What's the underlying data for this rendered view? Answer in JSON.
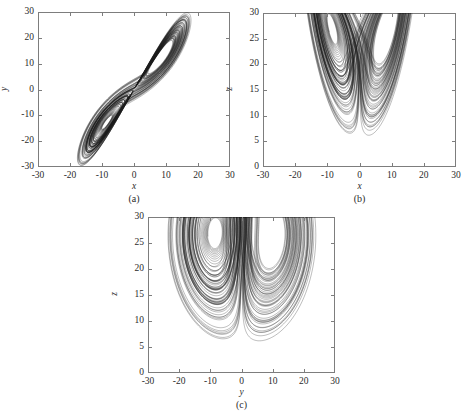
{
  "figure": {
    "background": "#ffffff",
    "line_color": "#1a1a1a",
    "axis_color": "#7d7d7d"
  },
  "panels": [
    {
      "id": "a",
      "caption": "(a)",
      "xlabel": "x",
      "ylabel": "y",
      "xlim": [
        -30,
        30
      ],
      "ylim": [
        -30,
        30
      ],
      "xticks": [
        -30,
        -20,
        -10,
        0,
        10,
        20,
        30
      ],
      "xticklabels": [
        "-30",
        "-20",
        "-10",
        "0",
        "10",
        "20",
        "30"
      ],
      "yticks": [
        -30,
        -20,
        -10,
        0,
        10,
        20,
        30
      ],
      "yticklabels": [
        "-30",
        "-20",
        "-10",
        "0",
        "10",
        "20",
        "30"
      ],
      "box": {
        "left": 38,
        "top": 12,
        "width": 192,
        "height": 155
      }
    },
    {
      "id": "b",
      "caption": "(b)",
      "xlabel": "x",
      "ylabel": "z",
      "xlim": [
        -30,
        30
      ],
      "ylim": [
        0,
        30
      ],
      "xticks": [
        -30,
        -20,
        -10,
        0,
        10,
        20,
        30
      ],
      "xticklabels": [
        "-30",
        "-20",
        "-10",
        "0",
        "10",
        "20",
        "30"
      ],
      "yticks": [
        0,
        5,
        10,
        15,
        20,
        25,
        30
      ],
      "yticklabels": [
        "0",
        "5",
        "10",
        "15",
        "20",
        "25",
        "30"
      ],
      "box": {
        "left": 263,
        "top": 13,
        "width": 193,
        "height": 154
      }
    },
    {
      "id": "c",
      "caption": "(c)",
      "xlabel": "y",
      "ylabel": "z",
      "xlim": [
        -30,
        30
      ],
      "ylim": [
        0,
        30
      ],
      "xticks": [
        -30,
        -20,
        -10,
        0,
        10,
        20,
        30
      ],
      "xticklabels": [
        "-30",
        "-20",
        "-10",
        "0",
        "10",
        "20",
        "30"
      ],
      "yticks": [
        0,
        5,
        10,
        15,
        20,
        25,
        30
      ],
      "yticklabels": [
        "0",
        "5",
        "10",
        "15",
        "20",
        "25",
        "30"
      ],
      "box": {
        "left": 148,
        "top": 217,
        "width": 187,
        "height": 156
      }
    }
  ],
  "chart_data": {
    "type": "line",
    "title": "",
    "system": {
      "name": "lorenz",
      "sigma": 10,
      "rho": 28,
      "beta": 2.6666666667,
      "initial_state": [
        1.0,
        1.0,
        1.0
      ],
      "dt": 0.0045,
      "steps": 22000,
      "discard": 600
    },
    "projections": [
      {
        "panel": "a",
        "x": "x",
        "y": "y",
        "xlim": [
          -30,
          30
        ],
        "ylim": [
          -30,
          30
        ]
      },
      {
        "panel": "b",
        "x": "x",
        "y": "z",
        "xlim": [
          -30,
          30
        ],
        "ylim": [
          0,
          30
        ]
      },
      {
        "panel": "c",
        "x": "y",
        "y": "z",
        "xlim": [
          -30,
          30
        ],
        "ylim": [
          0,
          30
        ]
      }
    ],
    "grid": false,
    "legend": null
  }
}
